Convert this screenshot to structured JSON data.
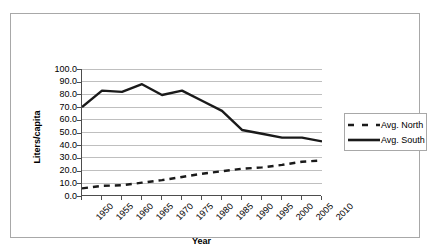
{
  "chart_data": {
    "type": "line",
    "title": "",
    "xlabel": "Year",
    "ylabel": "Liters/capita",
    "categories": [
      "1950",
      "1955",
      "1960",
      "1965",
      "1970",
      "1975",
      "1980",
      "1985",
      "1990",
      "1995",
      "2000",
      "2005",
      "2010"
    ],
    "series": [
      {
        "name": "Avg. North",
        "style": "dashed",
        "color": "#1a1a1a",
        "values": [
          6.0,
          8.0,
          8.5,
          10.5,
          12.5,
          15.0,
          17.5,
          19.5,
          21.5,
          22.5,
          24.5,
          27.0,
          28.0
        ]
      },
      {
        "name": "Avg. South",
        "style": "solid",
        "color": "#1a1a1a",
        "values": [
          70.0,
          83.0,
          82.0,
          88.0,
          79.5,
          83.0,
          75.0,
          67.0,
          52.0,
          49.0,
          46.0,
          46.0,
          43.0
        ]
      }
    ],
    "ylim": [
      0,
      100
    ],
    "ytick_step": 10,
    "ytick_labels": [
      "100.0",
      "90.0",
      "80.0",
      "70.0",
      "60.0",
      "50.0",
      "40.0",
      "30.0",
      "20.0",
      "10.0",
      "0.0"
    ],
    "grid": "horizontal",
    "legend_position": "right",
    "legend_entries": [
      "Avg. North",
      "Avg. South"
    ],
    "axis_color": "#4d4d4d",
    "gridline_color": "#bfbfbf",
    "frame_color": "#a8a8a8",
    "background": "#ffffff"
  }
}
